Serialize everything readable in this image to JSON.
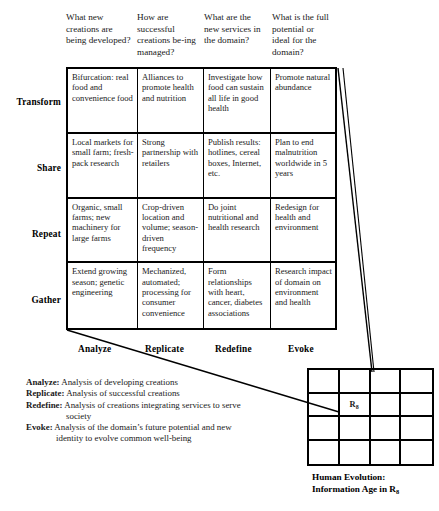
{
  "matrix": {
    "column_headers": [
      "What new creations are being developed?",
      "How are successful creations be-ing managed?",
      "What are the new services in the domain?",
      "What is the full potential or ideal for the domain?"
    ],
    "row_labels": [
      "Transform",
      "Share",
      "Repeat",
      "Gather"
    ],
    "axis_labels": [
      "Analyze",
      "Replicate",
      "Redefine",
      "Evoke"
    ],
    "rows": [
      {
        "label": "Transform",
        "cells": [
          "Bifurcation: real food and convenience food",
          "Alliances to promote health and nutrition",
          "Investigate how food can sustain all life in good health",
          "Promote natural abundance"
        ]
      },
      {
        "label": "Share",
        "cells": [
          "Local markets for small farm; fresh-pack research",
          "Strong partnership with retailers",
          "Publish results: hotlines, cereal boxes, Internet, etc.",
          "Plan to end malnutrition worldwide in 5 years"
        ]
      },
      {
        "label": "Repeat",
        "cells": [
          "Organic, small farms; new machinery for large farms",
          "Crop-driven location and volume; season-driven frequency",
          "Do joint nutritional and health research",
          "Redesign for health and environment"
        ]
      },
      {
        "label": "Gather",
        "cells": [
          "Extend growing season; genetic engineering",
          "Mechanized, automated; processing for consumer convenience",
          "Form relationships with heart, cancer, diabetes associations",
          "Research impact of domain on environment and health"
        ]
      }
    ]
  },
  "legend": [
    {
      "term": "Analyze:",
      "text": "Analysis of developing creations",
      "cont": ""
    },
    {
      "term": "Replicate:",
      "text": "Analysis of successful creations",
      "cont": ""
    },
    {
      "term": "Redefine:",
      "text": "Analysis of creations integrating services to serve",
      "cont": "society"
    },
    {
      "term": "Evoke:",
      "text": "Analysis of the domain’s future potential and new",
      "cont": "identity to evolve common well-being"
    }
  ],
  "small_grid": {
    "rows": 4,
    "cols": 4,
    "marked_cell": {
      "row": 2,
      "col": 2,
      "label": "R",
      "subscript": "8"
    },
    "caption_line1": "Human Evolution:",
    "caption_line2_prefix": "Information Age in R",
    "caption_line2_subscript": "8"
  },
  "colors": {
    "ink": "#1a1a1a",
    "border": "#000000",
    "background": "#ffffff"
  }
}
